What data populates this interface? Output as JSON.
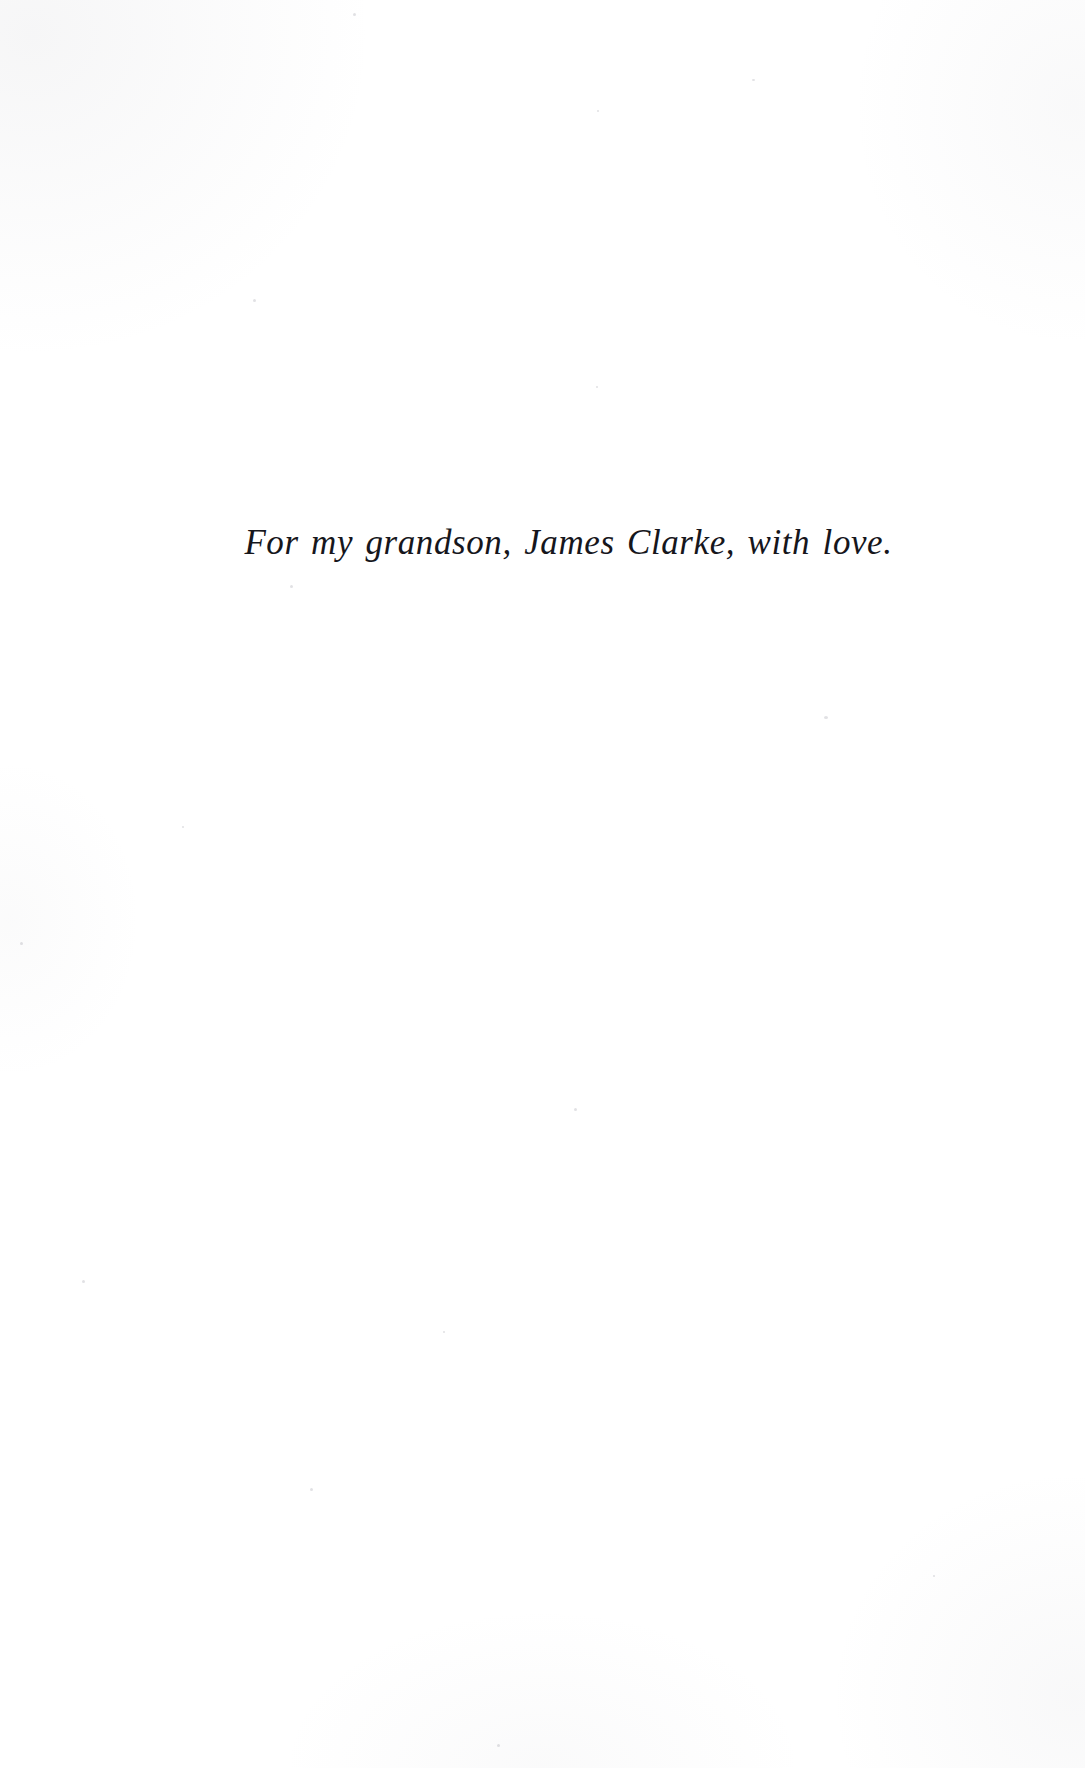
{
  "page": {
    "kind": "book-dedication-page",
    "background_color": "#ffffff",
    "width": 1085,
    "height": 1768
  },
  "dedication": {
    "text": "For my grandson, James Clarke, with love.",
    "text_color": "#16161c",
    "alignment": "center",
    "style": "italic-serif"
  }
}
